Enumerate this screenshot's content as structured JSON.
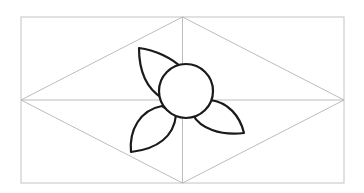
{
  "diagram": {
    "colors": {
      "background": "#ffffff",
      "guide_lines": "#b4b4b4",
      "flower_outline": "#1a1a1a"
    },
    "rectangle": {
      "x1": 21,
      "y1": 17,
      "x2": 344,
      "y2": 183
    },
    "center": {
      "x": 182.5,
      "y": 100
    },
    "circle": {
      "cx": 186,
      "cy": 91,
      "r": 27
    },
    "petals": [
      {
        "name": "upper-left",
        "tip": [
          139,
          48
        ]
      },
      {
        "name": "lower-left",
        "tip": [
          131,
          152
        ]
      },
      {
        "name": "right",
        "tip": [
          244,
          133
        ]
      }
    ]
  }
}
